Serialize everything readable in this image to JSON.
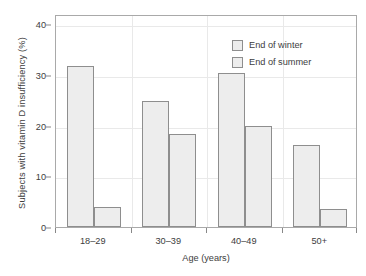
{
  "chart_data": {
    "type": "bar",
    "title": "",
    "xlabel": "Age (years)",
    "ylabel": "Subjects with vitamin D insufficiency (%)",
    "categories": [
      "18–29",
      "30–39",
      "40–49",
      "50+"
    ],
    "series": [
      {
        "name": "End of winter",
        "values": [
          31.7,
          24.8,
          30.4,
          16.1
        ]
      },
      {
        "name": "End of summer",
        "values": [
          4.0,
          18.4,
          19.9,
          3.6
        ]
      }
    ],
    "ylim": [
      0,
      42
    ],
    "yticks": [
      0,
      10,
      20,
      30,
      40
    ],
    "yticklabels": [
      "0",
      "10",
      "20",
      "30",
      "40"
    ],
    "grid": true,
    "grid_axis": "both",
    "legend_position": "top-right",
    "bar_fill_color": "#ededed",
    "bar_edge_color": "#8e8e8e",
    "axis_color": "#a9a9a9",
    "grid_color": "#e9e9e9",
    "text_color": "#3d3d3d"
  }
}
